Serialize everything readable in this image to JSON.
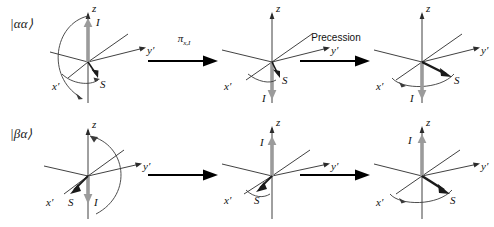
{
  "figure": {
    "background": "#ffffff",
    "axis_color": "#2b2b2b",
    "i_vector_color": "#9b9b9b",
    "s_vector_color": "#1a1a1a",
    "arc_color": "#3a3a3a",
    "arrow_color": "#000000"
  },
  "axes": {
    "z_label": "z",
    "y_label": "y′",
    "x_label": "x′"
  },
  "vectors": {
    "i_label": "I",
    "s_label": "S"
  },
  "rows": [
    {
      "ket": "|αα⟩",
      "panels": [
        {
          "name": "alpha-alpha-initial",
          "i_direction": "up",
          "s_direction": "down-front",
          "arc": "left"
        },
        {
          "name": "alpha-alpha-after-pulse",
          "i_direction": "down",
          "s_direction": "down-front",
          "arc": "none"
        },
        {
          "name": "alpha-alpha-after-precession",
          "i_direction": "down",
          "s_direction": "toward-y",
          "arc": "bottom"
        }
      ],
      "connectors": [
        {
          "label": "π",
          "sub": "x,I",
          "style": "symbol"
        },
        {
          "label": "Precession",
          "sub": "",
          "style": "word"
        }
      ]
    },
    {
      "ket": "|βα⟩",
      "panels": [
        {
          "name": "beta-alpha-initial",
          "i_direction": "down",
          "s_direction": "down-left",
          "arc": "right"
        },
        {
          "name": "beta-alpha-after-pulse",
          "i_direction": "up",
          "s_direction": "down-left",
          "arc": "none"
        },
        {
          "name": "beta-alpha-after-precession",
          "i_direction": "up",
          "s_direction": "toward-y",
          "arc": "bottom"
        }
      ],
      "connectors": [
        {
          "label": "",
          "sub": "",
          "style": "plain"
        },
        {
          "label": "",
          "sub": "",
          "style": "plain"
        }
      ]
    }
  ]
}
